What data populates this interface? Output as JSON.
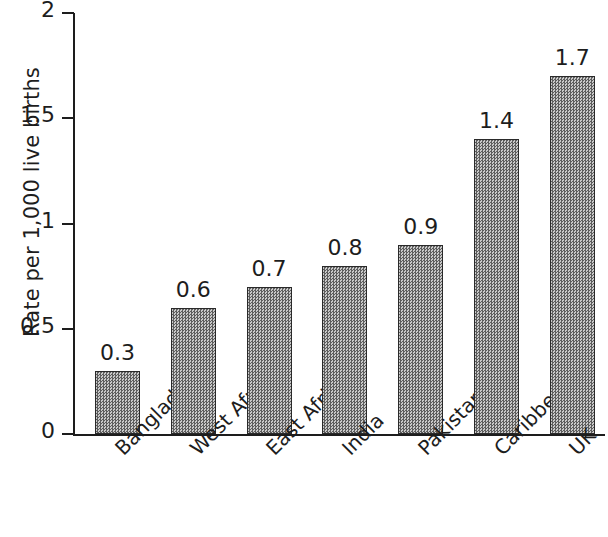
{
  "chart_data": {
    "type": "bar",
    "title": "",
    "xlabel": "",
    "ylabel": "Rate per 1,000 live births",
    "categories": [
      "Bangladesh",
      "West Africa",
      "East Africa",
      "India",
      "Pakistan",
      "Caribbean",
      "UK"
    ],
    "values": [
      0.3,
      0.6,
      0.7,
      0.8,
      0.9,
      1.4,
      1.7
    ],
    "value_labels": [
      "0.3",
      "0.6",
      "0.7",
      "0.8",
      "0.9",
      "1.4",
      "1.7"
    ],
    "ylim": [
      0,
      2
    ],
    "yticks": [
      0,
      0.5,
      1,
      1.5,
      2
    ],
    "ytick_labels": [
      "0",
      "0.5",
      "1",
      "1.5",
      "2"
    ],
    "grid": false,
    "legend": null,
    "bar_fill": "#8e8e8e",
    "bar_edge": "#2a2a2a",
    "axis_color": "#1d1d1d",
    "background": "#ffffff"
  }
}
